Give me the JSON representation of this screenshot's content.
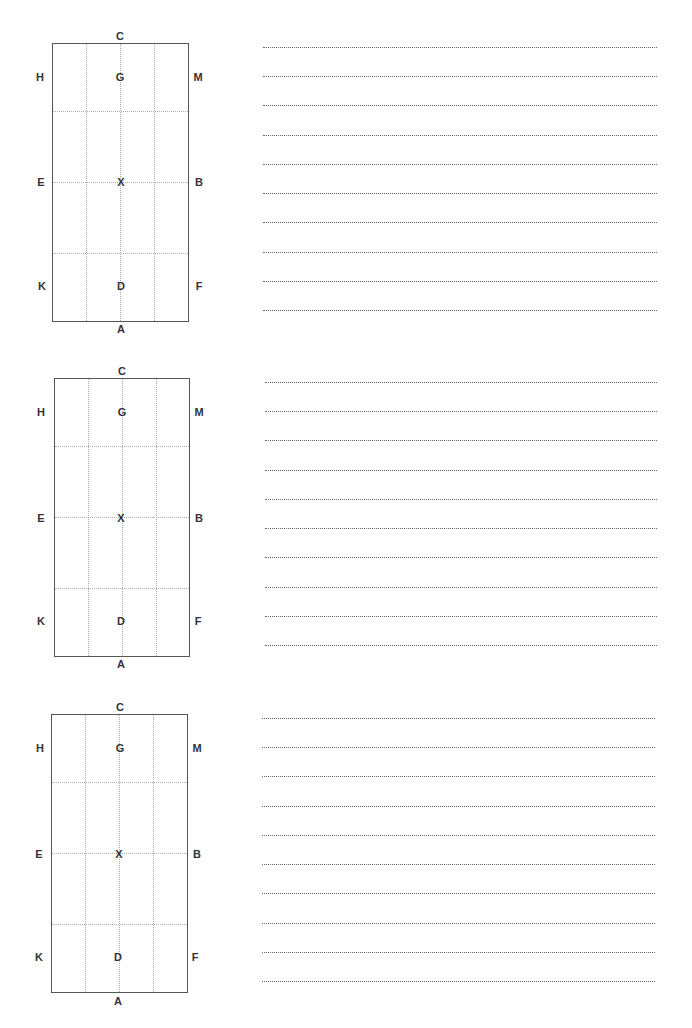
{
  "worksheet": {
    "arenas": [
      {
        "markers": {
          "top": "C",
          "bottom": "A",
          "left_top": "H",
          "left_mid": "E",
          "left_bottom": "K",
          "right_top": "M",
          "right_mid": "B",
          "right_bottom": "F",
          "center_top": "G",
          "center_mid": "X",
          "center_bottom": "D"
        },
        "note_lines": 10
      },
      {
        "markers": {
          "top": "C",
          "bottom": "A",
          "left_top": "H",
          "left_mid": "E",
          "left_bottom": "K",
          "right_top": "M",
          "right_mid": "B",
          "right_bottom": "F",
          "center_top": "G",
          "center_mid": "X",
          "center_bottom": "D"
        },
        "note_lines": 10
      },
      {
        "markers": {
          "top": "C",
          "bottom": "A",
          "left_top": "H",
          "left_mid": "E",
          "left_bottom": "K",
          "right_top": "M",
          "right_mid": "B",
          "right_bottom": "F",
          "center_top": "G",
          "center_mid": "X",
          "center_bottom": "D"
        },
        "note_lines": 10
      }
    ]
  }
}
